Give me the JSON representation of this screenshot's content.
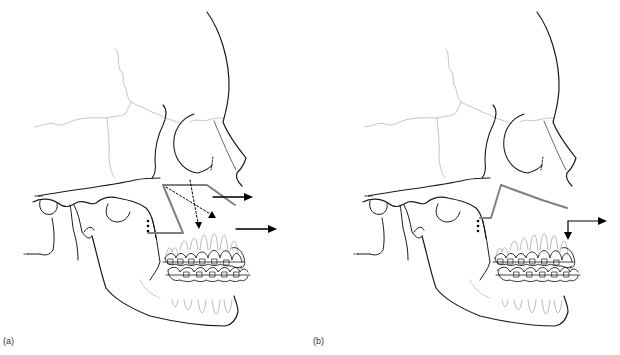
{
  "figure": {
    "panels": [
      {
        "id": "a",
        "label": "(a)",
        "description": "Skull profile with braces; gray polyline (occlusal/mandibular plane) and dashed vector arrows indicating forward movement of maxilla and upper teeth",
        "arrows": 2,
        "dashed_arrows": 2
      },
      {
        "id": "b",
        "label": "(b)",
        "description": "Skull profile with braces; gray polyline and small L-shaped arrow indicating anterior tooth intrusion/forward movement",
        "arrows": 1,
        "dashed_arrows": 0
      }
    ],
    "colors": {
      "bone_outline": "#1a1a1a",
      "suture_lines": "#b5b5b5",
      "teeth_lines": "#9a9a9a",
      "reference_line": "#808080",
      "arrow": "#000000"
    }
  }
}
